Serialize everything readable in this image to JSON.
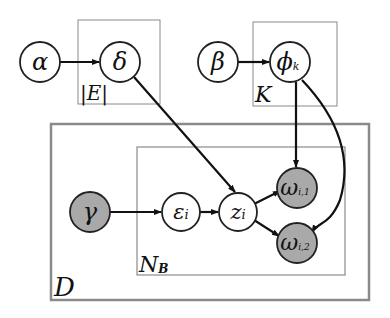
{
  "diagram": {
    "type": "plate-notation graphical model",
    "colors": {
      "observed_fill": "#a9a9a9",
      "latent_fill": "#ffffff",
      "stroke": "#222222",
      "plate_stroke": "#8a8a8a"
    },
    "nodes": {
      "alpha": {
        "label": "α",
        "observed": false
      },
      "delta": {
        "label": "δ",
        "observed": false
      },
      "beta": {
        "label": "β",
        "observed": false
      },
      "phi": {
        "label": "ϕ",
        "sub": "k",
        "observed": false
      },
      "gamma": {
        "label": "γ",
        "observed": true
      },
      "epsilon": {
        "label": "ε",
        "sub": "i",
        "observed": false
      },
      "z": {
        "label": "z",
        "sub": "i",
        "observed": false
      },
      "omega1": {
        "label": "ω",
        "sub": "i,1",
        "observed": true
      },
      "omega2": {
        "label": "ω",
        "sub": "i,2",
        "observed": true
      }
    },
    "plates": {
      "E": {
        "label": "|E|"
      },
      "K": {
        "label": "K"
      },
      "D": {
        "label": "D"
      },
      "NB": {
        "label": "N",
        "sub": "B"
      }
    },
    "edges": [
      [
        "alpha",
        "delta"
      ],
      [
        "beta",
        "phi"
      ],
      [
        "delta",
        "z"
      ],
      [
        "gamma",
        "epsilon"
      ],
      [
        "epsilon",
        "z"
      ],
      [
        "z",
        "omega1"
      ],
      [
        "z",
        "omega2"
      ],
      [
        "phi",
        "omega1"
      ],
      [
        "phi",
        "omega2"
      ]
    ]
  }
}
